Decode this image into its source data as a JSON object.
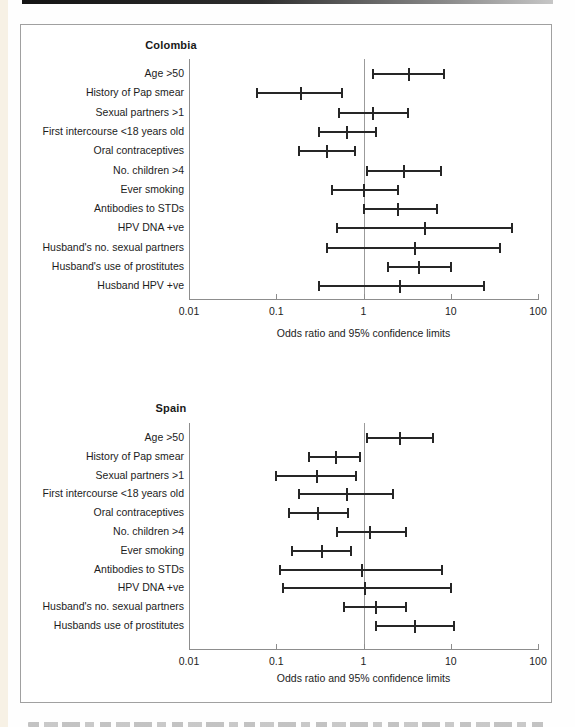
{
  "figure": {
    "kind": "forest-plot-figure",
    "caption_note": "partially cropped caption text visible at bottom edge (unreadable)"
  },
  "chart_data": [
    {
      "type": "scatter",
      "subtype": "forest-plot",
      "title": "Colombia",
      "xlabel": "Odds ratio and 95% confidence limits",
      "x_scale": "log",
      "xlim": [
        0.01,
        100
      ],
      "x_tick_values": [
        0.01,
        0.1,
        1,
        10,
        100
      ],
      "x_tick_labels": [
        "0.01",
        "0.1",
        "1",
        "10",
        "100"
      ],
      "reference_line_x": 1,
      "rows": [
        {
          "label": "Age >50",
          "lo": 1.3,
          "or": 3.3,
          "hi": 8.4
        },
        {
          "label": "History of Pap smear",
          "lo": 0.06,
          "or": 0.19,
          "hi": 0.57
        },
        {
          "label": "Sexual partners >1",
          "lo": 0.52,
          "or": 1.3,
          "hi": 3.2
        },
        {
          "label": "First intercourse <18 years old",
          "lo": 0.31,
          "or": 0.64,
          "hi": 1.4
        },
        {
          "label": "Oral contraceptives",
          "lo": 0.18,
          "or": 0.38,
          "hi": 0.79
        },
        {
          "label": "No. children >4",
          "lo": 1.1,
          "or": 2.9,
          "hi": 7.7
        },
        {
          "label": "Ever smoking",
          "lo": 0.43,
          "or": 1.0,
          "hi": 2.5
        },
        {
          "label": "Antibodies to STDs",
          "lo": 1.0,
          "or": 2.5,
          "hi": 6.9
        },
        {
          "label": "HPV DNA +ve",
          "lo": 0.49,
          "or": 5.1,
          "hi": 50
        },
        {
          "label": "Husband's no. sexual partners",
          "lo": 0.38,
          "or": 3.9,
          "hi": 37
        },
        {
          "label": "Husband's use of prostitutes",
          "lo": 1.9,
          "or": 4.3,
          "hi": 10
        },
        {
          "label": "Husband HPV +ve",
          "lo": 0.31,
          "or": 2.6,
          "hi": 24
        }
      ]
    },
    {
      "type": "scatter",
      "subtype": "forest-plot",
      "title": "Spain",
      "xlabel": "Odds ratio and 95% confidence limits",
      "x_scale": "log",
      "xlim": [
        0.01,
        100
      ],
      "x_tick_values": [
        0.01,
        0.1,
        1,
        10,
        100
      ],
      "x_tick_labels": [
        "0.01",
        "0.1",
        "1",
        "10",
        "100"
      ],
      "reference_line_x": 1,
      "rows": [
        {
          "label": "Age >50",
          "lo": 1.1,
          "or": 2.6,
          "hi": 6.3
        },
        {
          "label": "History of Pap smear",
          "lo": 0.24,
          "or": 0.48,
          "hi": 0.9
        },
        {
          "label": "Sexual partners >1",
          "lo": 0.1,
          "or": 0.29,
          "hi": 0.81
        },
        {
          "label": "First intercourse <18 years old",
          "lo": 0.18,
          "or": 0.64,
          "hi": 2.2
        },
        {
          "label": "Oral contraceptives",
          "lo": 0.14,
          "or": 0.3,
          "hi": 0.66
        },
        {
          "label": "No. children >4",
          "lo": 0.49,
          "or": 1.2,
          "hi": 3.1
        },
        {
          "label": "Ever smoking",
          "lo": 0.15,
          "or": 0.33,
          "hi": 0.72
        },
        {
          "label": "Antibodies to STDs",
          "lo": 0.11,
          "or": 0.95,
          "hi": 8.0
        },
        {
          "label": "HPV DNA +ve",
          "lo": 0.12,
          "or": 1.05,
          "hi": 10
        },
        {
          "label": "Husband's no. sexual partners",
          "lo": 0.6,
          "or": 1.4,
          "hi": 3.1
        },
        {
          "label": "Husbands use of prostitutes",
          "lo": 1.4,
          "or": 3.9,
          "hi": 11
        }
      ]
    }
  ]
}
